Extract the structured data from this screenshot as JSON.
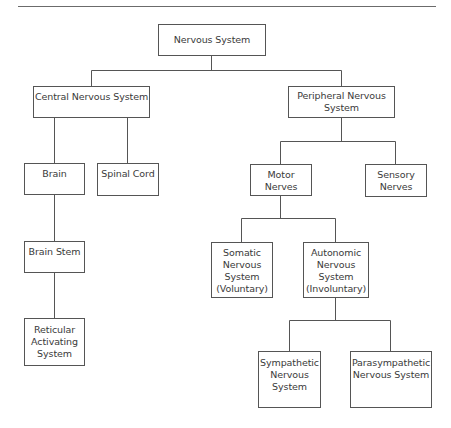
{
  "diagram": {
    "type": "hierarchy",
    "nodes": {
      "root": {
        "label": "Nervous System"
      },
      "cns": {
        "label": "Central Nervous System"
      },
      "pns": {
        "label": "Peripheral Nervous\nSystem"
      },
      "brain": {
        "label": "Brain"
      },
      "spinal_cord": {
        "label": "Spinal Cord"
      },
      "brain_stem": {
        "label": "Brain Stem"
      },
      "reticular": {
        "label": "Reticular\nActivating\nSystem"
      },
      "motor": {
        "label": "Motor\nNerves"
      },
      "sensory": {
        "label": "Sensory\nNerves"
      },
      "somatic": {
        "label": "Somatic\nNervous\nSystem\n(Voluntary)"
      },
      "autonomic": {
        "label": "Autonomic\nNervous\nSystem\n(Involuntary)"
      },
      "sympathetic": {
        "label": "Sympathetic\nNervous\nSystem"
      },
      "parasympathetic": {
        "label": "Parasympathetic\nNervous System"
      }
    },
    "edges": [
      [
        "root",
        "cns"
      ],
      [
        "root",
        "pns"
      ],
      [
        "cns",
        "brain"
      ],
      [
        "cns",
        "spinal_cord"
      ],
      [
        "brain",
        "brain_stem"
      ],
      [
        "brain_stem",
        "reticular"
      ],
      [
        "pns",
        "motor"
      ],
      [
        "pns",
        "sensory"
      ],
      [
        "motor",
        "somatic"
      ],
      [
        "motor",
        "autonomic"
      ],
      [
        "autonomic",
        "sympathetic"
      ],
      [
        "autonomic",
        "parasympathetic"
      ]
    ]
  }
}
